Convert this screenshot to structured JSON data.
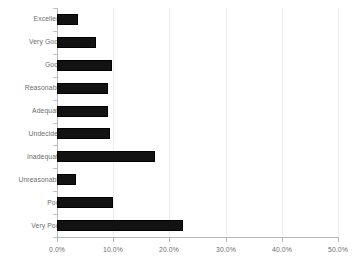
{
  "chart_data": {
    "type": "bar",
    "orientation": "horizontal",
    "title": "",
    "subtitle": "",
    "xlabel": "",
    "ylabel": "",
    "grid": true,
    "legend": false,
    "xlim": [
      0,
      50
    ],
    "xtick_labels": [
      "0.0%",
      "10.0%",
      "20.0%",
      "30.0%",
      "40.0%",
      "50.0%"
    ],
    "xticks": [
      0,
      10,
      20,
      30,
      40,
      50
    ],
    "categories": [
      "Excellent",
      "Very Good",
      "Good",
      "Reasonable",
      "Adequate",
      "Undecided",
      "Inadequate",
      "Unreasonable",
      "Poor",
      "Very Poor"
    ],
    "values": [
      3.7,
      7.0,
      9.8,
      9.1,
      9.1,
      9.4,
      17.5,
      3.4,
      10.0,
      22.5
    ],
    "value_labels": [
      "3.7%",
      "7.0%",
      "9.8%",
      "9.1%",
      "9.1%",
      "9.4%",
      "17.5%",
      "3.4%",
      "10.0%",
      "22.5%"
    ],
    "bar_color": "#121212",
    "axis_color": "#b8b8b8",
    "grid_color": "#ededed",
    "label_color": "#6d6d6d",
    "background_color": "#ffffff"
  }
}
